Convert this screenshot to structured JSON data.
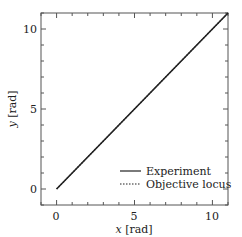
{
  "chart_data": {
    "type": "line",
    "title": "",
    "xlabel": "x [rad]",
    "ylabel": "y [rad]",
    "xlabel_var": "x",
    "xlabel_unit": " [rad]",
    "ylabel_var": "y",
    "ylabel_unit": " [rad]",
    "xlim": [
      -1,
      11
    ],
    "ylim": [
      -1,
      11
    ],
    "xticks_major": [
      0,
      5,
      10
    ],
    "yticks_major": [
      0,
      5,
      10
    ],
    "xtick_labels": [
      "0",
      "5",
      "10"
    ],
    "ytick_labels": [
      "0",
      "5",
      "10"
    ],
    "minor_tick_step": 1,
    "grid": false,
    "legend_position": "lower right",
    "series": [
      {
        "name": "Experiment",
        "style": "solid",
        "color": "#222222",
        "x": [
          0,
          11
        ],
        "y": [
          0,
          11
        ]
      },
      {
        "name": "Objective locus",
        "style": "dotted",
        "color": "#222222",
        "x": [
          0,
          11
        ],
        "y": [
          0,
          11
        ]
      }
    ]
  },
  "legend": {
    "items": [
      {
        "label": "Experiment"
      },
      {
        "label": "Objective locus"
      }
    ]
  },
  "axes": {
    "x_label_var": "x",
    "x_label_unit": " [rad]",
    "y_label_var": "y",
    "y_label_unit": " [rad]",
    "x_ticks": [
      "0",
      "5",
      "10"
    ],
    "y_ticks": [
      "0",
      "5",
      "10"
    ]
  }
}
